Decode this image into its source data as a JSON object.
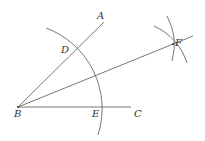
{
  "diagram": {
    "points": {
      "A": {
        "label": "A",
        "x": 97,
        "y": 19
      },
      "B": {
        "label": "B",
        "x": 14,
        "y": 117
      },
      "C": {
        "label": "C",
        "x": 134,
        "y": 117
      },
      "D": {
        "label": "D",
        "x": 62,
        "y": 53
      },
      "E": {
        "label": "E",
        "x": 92,
        "y": 117
      },
      "F": {
        "label": "F",
        "x": 175,
        "y": 46
      }
    },
    "colors": {
      "line": "#555555",
      "label": "#333333"
    }
  }
}
